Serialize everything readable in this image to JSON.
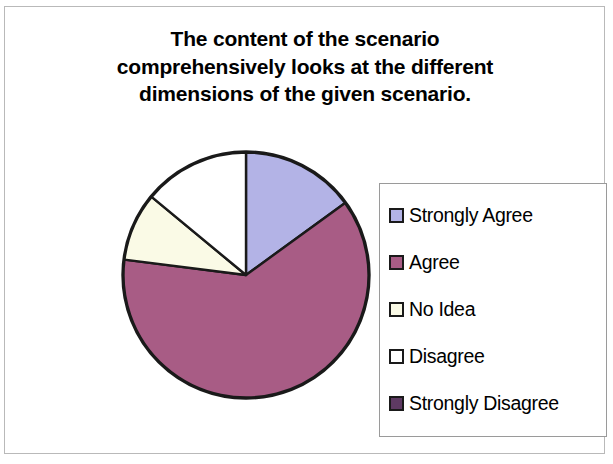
{
  "chart_data": {
    "type": "pie",
    "title": "The content of the scenario comprehensively looks at the different dimensions of the given scenario.",
    "title_lines": [
      "The content of the scenario",
      "comprehensively looks at the different",
      "dimensions of the given scenario."
    ],
    "categories": [
      "Strongly Agree",
      "Agree",
      "No Idea",
      "Disagree",
      "Strongly Disagree"
    ],
    "values": [
      15,
      62,
      9,
      14,
      0
    ],
    "unit": "percent",
    "colors": [
      "#b3b3e6",
      "#a85c85",
      "#fafae6",
      "#ffffff",
      "#5e3a63"
    ],
    "legend_position": "right",
    "start_angle_deg": 0,
    "direction": "clockwise",
    "slice_labels_shown": false,
    "grid": false,
    "xlabel": "",
    "ylabel": ""
  },
  "legend": {
    "items": [
      {
        "label": "Strongly Agree",
        "color": "#b3b3e6"
      },
      {
        "label": "Agree",
        "color": "#a85c85"
      },
      {
        "label": "No Idea",
        "color": "#fafae6"
      },
      {
        "label": "Disagree",
        "color": "#ffffff"
      },
      {
        "label": "Strongly Disagree",
        "color": "#5e3a63"
      }
    ]
  }
}
